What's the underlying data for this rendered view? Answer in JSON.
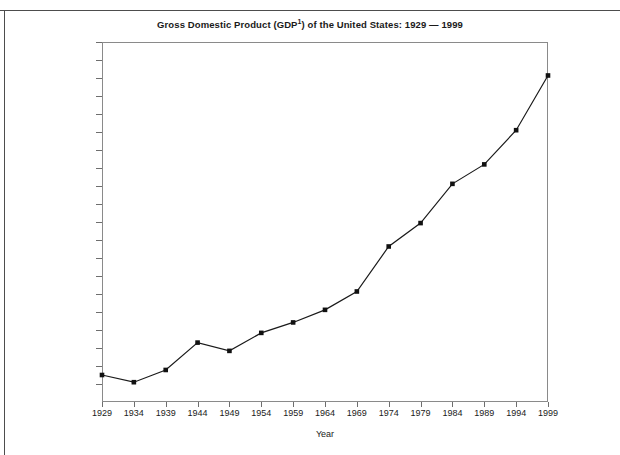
{
  "chart_data": {
    "type": "line",
    "title_main": "Gross Domestic Product (GDP",
    "title_sup": "1",
    "title_tail": ") of the United States: 1929 — 1999",
    "xlabel": "Year",
    "ylabel": "",
    "x": [
      1929,
      1934,
      1939,
      1944,
      1949,
      1954,
      1959,
      1964,
      1969,
      1974,
      1979,
      1984,
      1989,
      1994,
      1999
    ],
    "categories": [
      "1929",
      "1934",
      "1939",
      "1944",
      "1949",
      "1954",
      "1959",
      "1964",
      "1969",
      "1974",
      "1979",
      "1984",
      "1989",
      "1994",
      "1999"
    ],
    "values": [
      750,
      550,
      890,
      1650,
      1420,
      1920,
      2210,
      2560,
      3070,
      4320,
      4970,
      6060,
      6600,
      7550,
      9070
    ],
    "series": [
      {
        "name": "GDP",
        "values": [
          750,
          550,
          890,
          1650,
          1420,
          1920,
          2210,
          2560,
          3070,
          4320,
          4970,
          6060,
          6600,
          7550,
          9070
        ]
      }
    ],
    "xlim": [
      1929,
      1999
    ],
    "ylim": [
      0,
      10000
    ],
    "ytick_values": [
      500,
      1000,
      1500,
      2000,
      2500,
      3000,
      3500,
      4000,
      4500,
      5000,
      5500,
      6000,
      6500,
      7000,
      7500,
      8000,
      8500,
      9000,
      9500,
      10000
    ],
    "ytick_labels": [
      "500",
      "1,000",
      "1,500",
      "2,000",
      "2,500",
      "3,000",
      "3,500",
      "4,000",
      "4,500",
      "5,000",
      "5,500",
      "6,000",
      "6,500",
      "7,000",
      "7,500",
      "8,000",
      "8,500",
      "9,000",
      "9,500",
      "10,000"
    ],
    "grid": false,
    "legend": "none",
    "line_color": "#1a1a1a",
    "marker_color": "#111111",
    "marker": "square",
    "frame_color": "#8a8a8a"
  }
}
